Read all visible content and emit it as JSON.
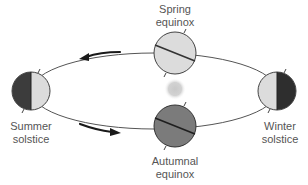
{
  "diagram": {
    "labels": {
      "spring": {
        "line1": "Spring",
        "line2": "equinox"
      },
      "summer": {
        "line1": "Summer",
        "line2": "solstice"
      },
      "winter": {
        "line1": "Winter",
        "line2": "solstice"
      },
      "autumn": {
        "line1": "Autumnal",
        "line2": "equinox"
      }
    },
    "nodes": [
      {
        "id": "spring-equinox",
        "position": "top",
        "shading": "light",
        "axis": "tilted"
      },
      {
        "id": "summer-solstice",
        "position": "left",
        "shading": "left-half-dark",
        "axis": "vertical"
      },
      {
        "id": "winter-solstice",
        "position": "right",
        "shading": "right-half-dark",
        "axis": "vertical"
      },
      {
        "id": "autumnal-equinox",
        "position": "bottom",
        "shading": "dark",
        "axis": "tilted"
      },
      {
        "id": "sun",
        "position": "center",
        "shading": "blurred-gray"
      }
    ],
    "arrows": [
      {
        "id": "upper-arrow",
        "direction": "left"
      },
      {
        "id": "lower-arrow",
        "direction": "right"
      }
    ],
    "colors": {
      "orbit": "#555555",
      "globe_light": "#dcdcdc",
      "globe_dark": "#3c3c3c",
      "globe_mid": "#7b7b7b",
      "sun": "#cfcfcf",
      "label": "#555555",
      "arrow": "#1a1a1a"
    }
  }
}
